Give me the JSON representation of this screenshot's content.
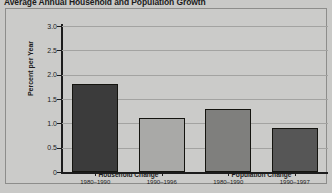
{
  "chart_data": {
    "type": "bar",
    "title": "Average Annual Household and Population Growth",
    "xlabel": "",
    "ylabel": "Percent per Year",
    "ylim": [
      0,
      3.0
    ],
    "ytick_labels": [
      "3.0",
      "2.5",
      "2.0",
      "1.5",
      "1.0",
      "0.5",
      "0"
    ],
    "ytick_values": [
      3.0,
      2.5,
      2.0,
      1.5,
      1.0,
      0.5,
      0
    ],
    "grid": true,
    "legend": "none",
    "categories": [
      "1980–1990",
      "1990–1996",
      "1980–1990",
      "1990–1997"
    ],
    "values": [
      1.8,
      1.1,
      1.3,
      0.9
    ],
    "bar_colors": [
      "#3b3b3b",
      "#a9a9a7",
      "#7f7f7d",
      "#565656"
    ],
    "groups": [
      {
        "label": "Household Change",
        "bars": [
          {
            "period": "1980–1990",
            "value": 1.8,
            "color": "#3b3b3b"
          },
          {
            "period": "1990–1996",
            "value": 1.1,
            "color": "#a9a9a7"
          }
        ]
      },
      {
        "label": "Population Change",
        "bars": [
          {
            "period": "1980–1990",
            "value": 1.3,
            "color": "#7f7f7d"
          },
          {
            "period": "1990–1997",
            "value": 0.9,
            "color": "#565656"
          }
        ]
      }
    ]
  }
}
